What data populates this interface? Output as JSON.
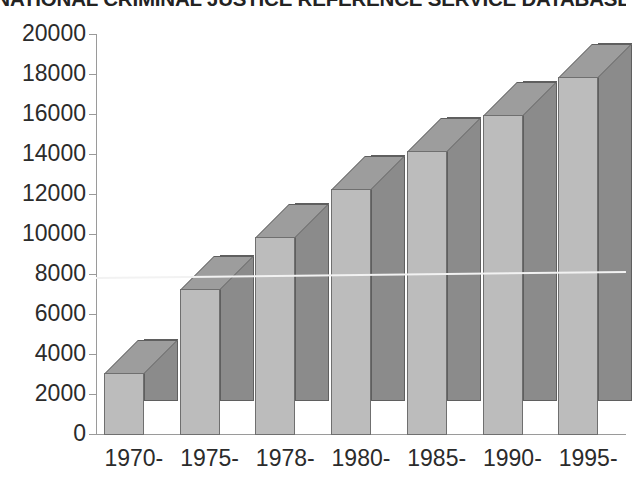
{
  "chart_data": {
    "type": "bar",
    "title": "NATIONAL CRIMINAL JUSTICE REFERENCE SERVICE DATABASE",
    "subtitle": "",
    "xlabel": "",
    "ylabel": "",
    "ylim": [
      0,
      20000
    ],
    "yticks": [
      0,
      2000,
      4000,
      6000,
      8000,
      10000,
      12000,
      14000,
      16000,
      18000,
      20000
    ],
    "ytick_labels": [
      "0",
      "2000",
      "4000",
      "6000",
      "8000",
      "10000",
      "12000",
      "14000",
      "16000",
      "18000",
      "20000"
    ],
    "grid": false,
    "legend": null,
    "style": "3d-bar",
    "categories": [
      "1970-",
      "1975-",
      "1978-",
      "1980-",
      "1985-",
      "1990-",
      "1995-"
    ],
    "values": [
      3100,
      7300,
      9900,
      12300,
      14200,
      16000,
      17900
    ],
    "series": [
      {
        "name": "Documents",
        "values": [
          3100,
          7300,
          9900,
          12300,
          14200,
          16000,
          17900
        ]
      }
    ],
    "annotations": [
      {
        "type": "line",
        "name": "white-horizontal-line",
        "y_start": 7850,
        "y_end": 8150,
        "color": "#f2f2f2"
      }
    ],
    "colors": {
      "bar_front": "#bcbcbc",
      "bar_side": "#8b8b8b",
      "bar_top": "#9d9d9d",
      "bar_outline": "#6f6f6f",
      "axis": "#9a9a9a",
      "text": "#2b2b2b",
      "background": "#ffffff",
      "trend_line": "#f2f2f2"
    }
  }
}
